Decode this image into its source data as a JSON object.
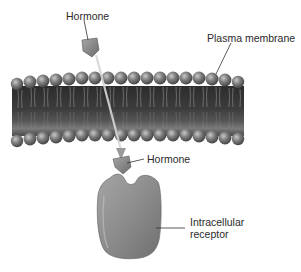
{
  "diagram": {
    "labels": {
      "hormone_outside": "Hormone",
      "plasma_membrane": "Plasma membrane",
      "hormone_inside": "Hormone",
      "receptor_line1": "Intracellular",
      "receptor_line2": "receptor"
    },
    "colors": {
      "background": "#ffffff",
      "membrane_core": "#3a3a3a",
      "phospholipid_head": "#7a7a7a",
      "hormone": "#8a8a8a",
      "receptor": "#8e8e8e",
      "label_text": "#2a2a2a",
      "leader_line": "#333333"
    }
  }
}
